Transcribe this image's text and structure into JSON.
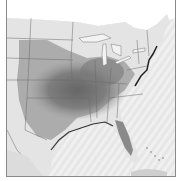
{
  "map": {
    "type": "grayscale shaded data map",
    "region": "Central and Eastern United States",
    "colors": {
      "ocean": "#eeeeee",
      "land_light": "#e6e6e6",
      "shade_mid": "#a8a8a8",
      "shade_dark": "#6f6f6f",
      "borders": "#555555",
      "frame": "#8a8a8a"
    }
  }
}
